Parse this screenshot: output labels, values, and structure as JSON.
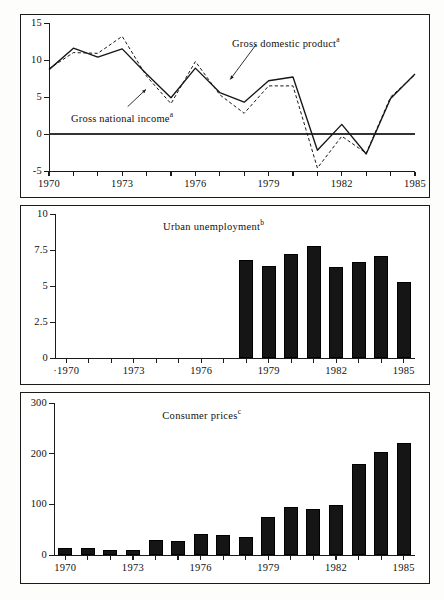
{
  "figure": {
    "background": "#ffffff",
    "ink": "#151515"
  },
  "charts": [
    {
      "id": "gdp",
      "type": "line",
      "title": "",
      "annotations": [
        {
          "name": "gross-domestic-product-label",
          "text": "Gross domestic product",
          "sup": "a"
        },
        {
          "name": "gross-national-income-label",
          "text": "Gross national income",
          "sup": "a"
        }
      ],
      "ylim": [
        -5,
        15
      ],
      "yticks": [
        -5,
        0,
        5,
        10,
        15
      ],
      "ytick_labels": [
        "-5",
        "0",
        "5",
        "10",
        "15"
      ],
      "x": [
        1970,
        1971,
        1972,
        1973,
        1974,
        1975,
        1976,
        1977,
        1978,
        1979,
        1980,
        1981,
        1982,
        1983,
        1984,
        1985
      ],
      "xticks": [
        1970,
        1971,
        1972,
        1973,
        1974,
        1975,
        1976,
        1977,
        1978,
        1979,
        1980,
        1981,
        1982,
        1983,
        1984,
        1985
      ],
      "xtick_labels": [
        "1970",
        "",
        "",
        "1973",
        "",
        "",
        "1976",
        "",
        "",
        "1979",
        "",
        "",
        "1982",
        "",
        "",
        "1985"
      ],
      "grid": false,
      "zero_line": true,
      "series": [
        {
          "name": "Gross domestic product",
          "style": "solid",
          "values": [
            8.7,
            11.6,
            10.4,
            11.5,
            8.1,
            4.9,
            8.9,
            5.6,
            4.3,
            7.2,
            7.7,
            -2.2,
            1.3,
            -2.7,
            4.8,
            8.1
          ]
        },
        {
          "name": "Gross national income",
          "style": "dashed",
          "values": [
            8.8,
            11.0,
            10.9,
            13.2,
            7.8,
            4.1,
            9.8,
            5.3,
            2.8,
            6.5,
            6.5,
            -4.6,
            -0.3,
            -2.6,
            5.0,
            8.0
          ]
        }
      ]
    },
    {
      "id": "unemployment",
      "type": "bar",
      "title": "Urban unemployment",
      "title_sup": "b",
      "ylim": [
        0,
        10
      ],
      "yticks": [
        0,
        2.5,
        5,
        7.5,
        10
      ],
      "ytick_labels": [
        "0",
        "2.5",
        "5",
        "7.5",
        "10"
      ],
      "xticks": [
        1970,
        1971,
        1972,
        1973,
        1974,
        1975,
        1976,
        1977,
        1978,
        1979,
        1980,
        1981,
        1982,
        1983,
        1984,
        1985
      ],
      "xtick_labels": [
        "·1970",
        "",
        "",
        "1973",
        "",
        "",
        "1976",
        "",
        "",
        "1979",
        "",
        "",
        "1982",
        "",
        "",
        "1985"
      ],
      "categories": [
        1978,
        1979,
        1980,
        1981,
        1982,
        1983,
        1984,
        1985
      ],
      "values": [
        6.8,
        6.4,
        7.2,
        7.8,
        6.3,
        6.7,
        7.1,
        5.3
      ],
      "grid": false
    },
    {
      "id": "prices",
      "type": "bar",
      "title": "Consumer prices",
      "title_sup": "c",
      "ylim": [
        0,
        300
      ],
      "yticks": [
        0,
        100,
        200,
        300
      ],
      "ytick_labels": [
        "0",
        "100",
        "200",
        "300"
      ],
      "xticks": [
        1970,
        1971,
        1972,
        1973,
        1974,
        1975,
        1976,
        1977,
        1978,
        1979,
        1980,
        1981,
        1982,
        1983,
        1984,
        1985
      ],
      "xtick_labels": [
        "1970",
        "",
        "",
        "1973",
        "",
        "",
        "1976",
        "",
        "",
        "1979",
        "",
        "",
        "1982",
        "",
        "",
        "1985"
      ],
      "categories": [
        1970,
        1971,
        1972,
        1973,
        1974,
        1975,
        1976,
        1977,
        1978,
        1979,
        1980,
        1981,
        1982,
        1983,
        1984,
        1985
      ],
      "values": [
        13,
        13,
        9,
        9,
        30,
        27,
        42,
        40,
        35,
        75,
        95,
        91,
        98,
        180,
        203,
        222
      ],
      "grid": false
    }
  ],
  "chart_data": [
    {
      "type": "line",
      "title": "",
      "xlabel": "",
      "ylabel": "",
      "ylim": [
        -5,
        15
      ],
      "grid": false,
      "legend_position": "inline-annotations",
      "x": [
        1970,
        1971,
        1972,
        1973,
        1974,
        1975,
        1976,
        1977,
        1978,
        1979,
        1980,
        1981,
        1982,
        1983,
        1984,
        1985
      ],
      "tick_labels": [
        "1970",
        "1973",
        "1976",
        "1979",
        "1982",
        "1985"
      ],
      "y_tick_labels": [
        "-5",
        "0",
        "5",
        "10",
        "15"
      ],
      "series": [
        {
          "name": "Gross domestic product a",
          "values": [
            8.7,
            11.6,
            10.4,
            11.5,
            8.1,
            4.9,
            8.9,
            5.6,
            4.3,
            7.2,
            7.7,
            -2.2,
            1.3,
            -2.7,
            4.8,
            8.1
          ]
        },
        {
          "name": "Gross national income a",
          "values": [
            8.8,
            11.0,
            10.9,
            13.2,
            7.8,
            4.1,
            9.8,
            5.3,
            2.8,
            6.5,
            6.5,
            -4.6,
            -0.3,
            -2.6,
            5.0,
            8.0
          ]
        }
      ],
      "annotations": [
        "Gross domestic product",
        "Gross national income"
      ]
    },
    {
      "type": "bar",
      "title": "Urban unemployment",
      "xlabel": "",
      "ylabel": "",
      "ylim": [
        0,
        10
      ],
      "grid": false,
      "categories": [
        1978,
        1979,
        1980,
        1981,
        1982,
        1983,
        1984,
        1985
      ],
      "values": [
        6.8,
        6.4,
        7.2,
        7.8,
        6.3,
        6.7,
        7.1,
        5.3
      ],
      "y_tick_labels": [
        "0",
        "2.5",
        "5",
        "7.5",
        "10"
      ],
      "tick_labels": [
        "1970",
        "1973",
        "1976",
        "1979",
        "1982",
        "1985"
      ]
    },
    {
      "type": "bar",
      "title": "Consumer prices",
      "xlabel": "",
      "ylabel": "",
      "ylim": [
        0,
        300
      ],
      "grid": false,
      "categories": [
        1970,
        1971,
        1972,
        1973,
        1974,
        1975,
        1976,
        1977,
        1978,
        1979,
        1980,
        1981,
        1982,
        1983,
        1984,
        1985
      ],
      "values": [
        13,
        13,
        9,
        9,
        30,
        27,
        42,
        40,
        35,
        75,
        95,
        91,
        98,
        180,
        203,
        222
      ],
      "y_tick_labels": [
        "0",
        "100",
        "200",
        "300"
      ],
      "tick_labels": [
        "1970",
        "1973",
        "1976",
        "1979",
        "1982",
        "1985"
      ]
    }
  ]
}
